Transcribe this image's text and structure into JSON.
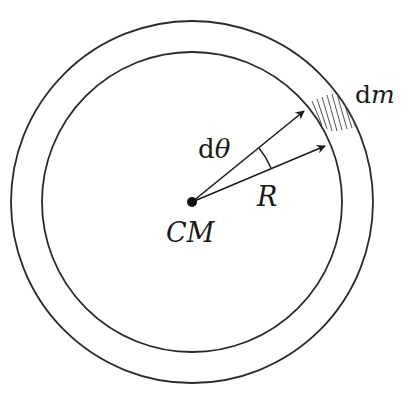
{
  "diagram": {
    "type": "ring-mass-element",
    "colors": {
      "stroke": "#2a2a2a",
      "background": "#ffffff",
      "hatch": "#555555"
    },
    "geometry": {
      "center": [
        192,
        202
      ],
      "outer_radius": 181,
      "inner_radius": 150
    },
    "labels": {
      "mass_element": "dm",
      "mass_element_prefix": "d",
      "mass_element_var": "m",
      "angle": "dθ",
      "angle_prefix": "d",
      "angle_var": "θ",
      "radius": "R",
      "center": "CM"
    },
    "elements": [
      {
        "name": "outer-circle",
        "kind": "circle"
      },
      {
        "name": "inner-circle",
        "kind": "circle"
      },
      {
        "name": "center-of-mass-dot",
        "kind": "point"
      },
      {
        "name": "radius-arrow-upper",
        "kind": "arrow"
      },
      {
        "name": "radius-arrow-lower",
        "kind": "arrow"
      },
      {
        "name": "angle-arc",
        "kind": "arc"
      },
      {
        "name": "mass-element-hatch",
        "kind": "hatched-region"
      }
    ]
  }
}
